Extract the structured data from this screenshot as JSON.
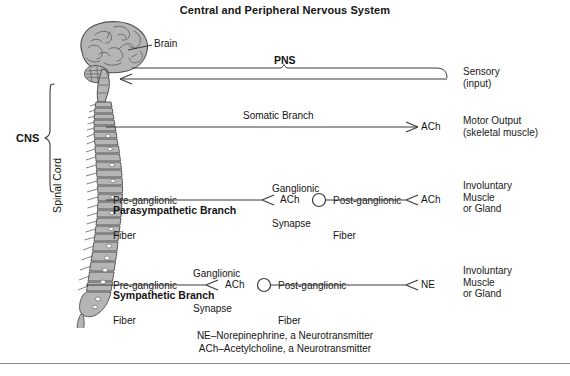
{
  "figure": {
    "title": "Central and Peripheral Nervous System",
    "type": "anatomical-schematic-diagram"
  },
  "anatomy": {
    "brain_label": "Brain",
    "spinal_cord_label": "Spinal Cord",
    "cns_label": "CNS",
    "pns_label": "PNS",
    "fill_color": "#b5b5b5",
    "line_color": "#4a4a4a"
  },
  "pathways": [
    {
      "id": "sensory",
      "direction": "afferent",
      "target_label": "Sensory\n(input)",
      "target_line1": "Sensory",
      "target_line2": "(input)",
      "bracket_label": "PNS"
    },
    {
      "id": "somatic",
      "direction": "efferent",
      "fiber_label": "Somatic Branch",
      "neurotransmitter": "ACh",
      "target_line1": "Motor Output",
      "target_line2": "(skeletal muscle)"
    },
    {
      "id": "parasympathetic",
      "direction": "efferent",
      "branch_label": "Parasympathetic Branch",
      "pre_fiber_line1": "Pre-ganglionic",
      "pre_fiber_line2": "Fiber",
      "synapse_line1": "Ganglionic",
      "synapse_line2": "Synapse",
      "post_fiber_line1": "Post-ganglionic",
      "post_fiber_line2": "Fiber",
      "pre_neurotransmitter": "ACh",
      "post_neurotransmitter": "ACh",
      "target_line1": "Involuntary",
      "target_line2": "Muscle",
      "target_line3": "or Gland"
    },
    {
      "id": "sympathetic",
      "direction": "efferent",
      "branch_label": "Sympathetic Branch",
      "pre_fiber_line1": "Pre-ganglionic",
      "pre_fiber_line2": "Fiber",
      "synapse_line1": "Ganglionic",
      "synapse_line2": "Synapse",
      "post_fiber_line1": "Post-ganglionic",
      "post_fiber_line2": "Fiber",
      "pre_neurotransmitter": "ACh",
      "post_neurotransmitter": "NE",
      "target_line1": "Involuntary",
      "target_line2": "Muscle",
      "target_line3": "or Gland"
    }
  ],
  "legend": {
    "line1": "NE–Norepinephrine, a Neurotransmitter",
    "line2": "ACh–Acetylcholine, a Neurotransmitter"
  }
}
